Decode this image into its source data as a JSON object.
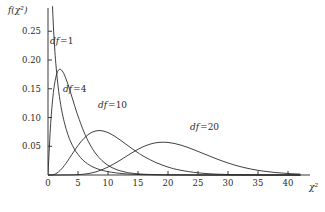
{
  "chart_data": {
    "type": "line",
    "title": "",
    "subtitle": "",
    "xlabel": "χ²",
    "ylabel": "f(χ²)",
    "xlim": [
      0,
      42
    ],
    "ylim": [
      0,
      0.28
    ],
    "grid": false,
    "legend_position": "inline-annotations",
    "x_ticks": [
      0,
      5,
      10,
      15,
      20,
      25,
      30,
      35,
      40
    ],
    "x_tick_labels": [
      "0",
      "5",
      "10",
      "15",
      "20",
      "25",
      "30",
      "35",
      "40"
    ],
    "y_ticks": [
      0.05,
      0.1,
      0.15,
      0.2,
      0.25
    ],
    "y_tick_labels": [
      "0.05",
      "0.10",
      "0.15",
      "0.20",
      "0.25"
    ],
    "series": [
      {
        "name": "df=1",
        "label": "df 1",
        "df": 1,
        "peak_x": 0.0,
        "peak_y": 0.28,
        "x": [
          0.15,
          0.25,
          0.35,
          0.5,
          0.7,
          0.9,
          1.1,
          1.3,
          1.6,
          2.0,
          2.4,
          2.8,
          3.3,
          3.8,
          4.4,
          5.0,
          5.8,
          6.6,
          7.5,
          8.5,
          9.5,
          11.0,
          13.0,
          15.0,
          17.0,
          20.0,
          24.0,
          28.0,
          33.0,
          38.0,
          42.0
        ],
        "y": [
          0.7712,
          0.5834,
          0.4758,
          0.3867,
          0.3079,
          0.2589,
          0.2226,
          0.1942,
          0.1614,
          0.1295,
          0.1063,
          0.0884,
          0.0708,
          0.0573,
          0.045,
          0.0358,
          0.0261,
          0.0194,
          0.0139,
          0.0098,
          0.007,
          0.0041,
          0.0019,
          0.0009,
          0.0004,
          0.0002,
          0.0,
          0.0,
          0.0,
          0.0,
          0.0
        ]
      },
      {
        "name": "df=4",
        "label": "df 4",
        "df": 4,
        "peak_x": 2.0,
        "peak_y": 0.1839,
        "x": [
          0,
          0.4,
          0.8,
          1.2,
          1.6,
          2.0,
          2.5,
          3.0,
          3.5,
          4.0,
          4.5,
          5.0,
          6.0,
          7.0,
          8.0,
          9.0,
          10.0,
          11.0,
          12.0,
          13.0,
          14.0,
          16.0,
          18.0,
          20.0,
          23.0,
          26.0,
          30.0,
          34.0,
          38.0,
          42.0
        ],
        "y": [
          0,
          0.0819,
          0.1341,
          0.1646,
          0.1798,
          0.1839,
          0.179,
          0.1673,
          0.1522,
          0.1353,
          0.1185,
          0.1026,
          0.0747,
          0.0529,
          0.0366,
          0.025,
          0.0168,
          0.0112,
          0.0074,
          0.0048,
          0.0031,
          0.0013,
          0.0006,
          0.0002,
          0.0001,
          0.0,
          0.0,
          0.0,
          0.0,
          0.0
        ]
      },
      {
        "name": "df=10",
        "label": "df 10",
        "df": 10,
        "peak_x": 8.0,
        "peak_y": 0.0976,
        "x": [
          0,
          1,
          2,
          3,
          4,
          5,
          6,
          7,
          8,
          9,
          10,
          11,
          12,
          13,
          14,
          15,
          16,
          18,
          20,
          22,
          25,
          28,
          31,
          34,
          37,
          40,
          42
        ],
        "y": [
          0,
          0.0008,
          0.0077,
          0.0203,
          0.036,
          0.0513,
          0.0638,
          0.0725,
          0.0767,
          0.0769,
          0.0737,
          0.0681,
          0.0611,
          0.0535,
          0.0459,
          0.0387,
          0.0322,
          0.0216,
          0.0138,
          0.0085,
          0.0037,
          0.0015,
          0.0006,
          0.0002,
          0.0001,
          0.0,
          0.0
        ]
      },
      {
        "name": "df=20",
        "label": "df 20",
        "df": 20,
        "peak_x": 18.0,
        "peak_y": 0.0646,
        "x": [
          0,
          2,
          4,
          6,
          8,
          10,
          12,
          14,
          16,
          18,
          20,
          22,
          24,
          26,
          28,
          30,
          32,
          34,
          36,
          38,
          40,
          42
        ],
        "y": [
          0,
          0.0,
          0.0002,
          0.0014,
          0.0055,
          0.0138,
          0.0255,
          0.0387,
          0.0498,
          0.0561,
          0.0566,
          0.0524,
          0.0452,
          0.0368,
          0.0284,
          0.0209,
          0.0147,
          0.01,
          0.0066,
          0.0042,
          0.0026,
          0.0016
        ]
      }
    ],
    "annotations": [
      {
        "text": "df 1",
        "series": "df=1",
        "x_px": 50,
        "y_px": 44
      },
      {
        "text": "df 4",
        "series": "df=4",
        "x_px": 63,
        "y_px": 92
      },
      {
        "text": "df 10",
        "series": "df=10",
        "x_px": 98,
        "y_px": 108
      },
      {
        "text": "df 20",
        "series": "df=20",
        "x_px": 190,
        "y_px": 130
      }
    ]
  },
  "axes": {
    "y_axis_title": "f(χ²)",
    "x_axis_title": "χ²"
  },
  "colors": {
    "background": "#ffffff",
    "curve": "#2b2b2b",
    "axis": "#3a3a3a",
    "text": "#2a2a2a"
  }
}
